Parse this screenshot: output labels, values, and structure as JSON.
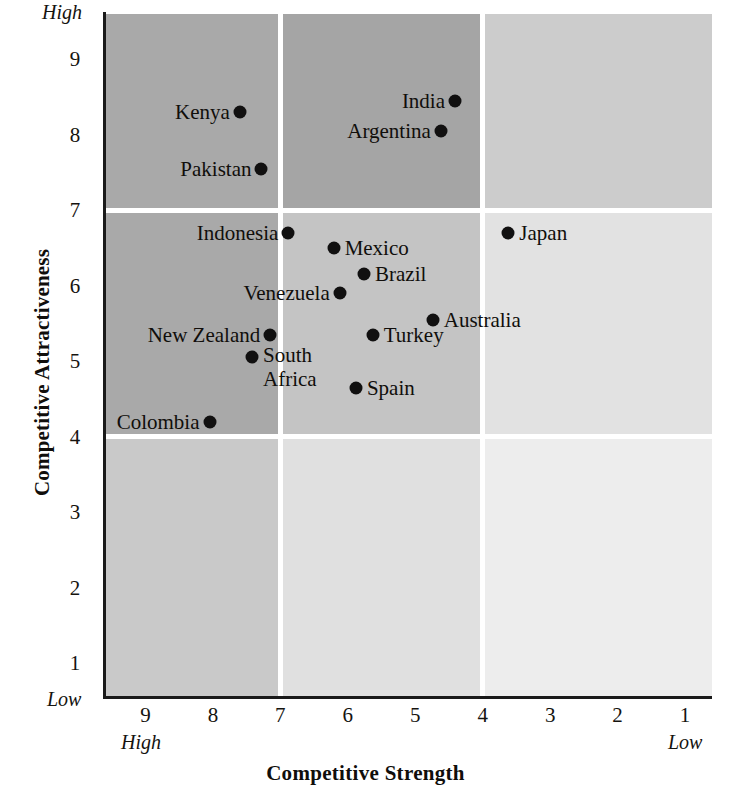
{
  "chart_data": {
    "type": "scatter",
    "title": "",
    "xlabel": "Competitive Strength",
    "ylabel": "Competitive Attractiveness",
    "xlim": [
      9.6,
      0.6
    ],
    "ylim": [
      0.55,
      9.6
    ],
    "x_reversed": true,
    "grid": true,
    "legend": "none",
    "x_ticks": [
      9,
      8,
      7,
      6,
      5,
      4,
      3,
      2,
      1
    ],
    "y_ticks": [
      9,
      8,
      7,
      6,
      5,
      4,
      3,
      2,
      1
    ],
    "x_axis_end_labels": {
      "left": "High",
      "right": "Low"
    },
    "y_axis_end_labels": {
      "top": "High",
      "bottom": "Low"
    },
    "quadrant_breaks": {
      "x": [
        7,
        4
      ],
      "y": [
        7,
        4
      ]
    },
    "quadrant_shades": [
      [
        "#a9a9a9",
        "#a5a5a5",
        "#cccccc"
      ],
      [
        "#a9a9a9",
        "#c4c4c4",
        "#e2e2e2"
      ],
      [
        "#c9c9c9",
        "#e0e0e0",
        "#ededed"
      ]
    ],
    "points": [
      {
        "name": "Kenya",
        "x": 7.6,
        "y": 8.3,
        "label_side": "left"
      },
      {
        "name": "Pakistan",
        "x": 7.28,
        "y": 7.55,
        "label_side": "left"
      },
      {
        "name": "India",
        "x": 4.41,
        "y": 8.45,
        "label_side": "left"
      },
      {
        "name": "Argentina",
        "x": 4.62,
        "y": 8.05,
        "label_side": "left"
      },
      {
        "name": "Indonesia",
        "x": 6.88,
        "y": 6.7,
        "label_side": "left"
      },
      {
        "name": "Japan",
        "x": 3.62,
        "y": 6.7,
        "label_side": "right"
      },
      {
        "name": "Mexico",
        "x": 6.21,
        "y": 6.5,
        "label_side": "right"
      },
      {
        "name": "Brazil",
        "x": 5.76,
        "y": 6.15,
        "label_side": "right"
      },
      {
        "name": "Venezuela",
        "x": 6.12,
        "y": 5.9,
        "label_side": "left"
      },
      {
        "name": "Australia",
        "x": 4.74,
        "y": 5.55,
        "label_side": "right"
      },
      {
        "name": "Turkey",
        "x": 5.63,
        "y": 5.35,
        "label_side": "right"
      },
      {
        "name": "New Zealand",
        "x": 7.15,
        "y": 5.35,
        "label_side": "left"
      },
      {
        "name": "South Africa",
        "x": 7.42,
        "y": 5.05,
        "label_side": "right"
      },
      {
        "name": "Spain",
        "x": 5.88,
        "y": 4.65,
        "label_side": "right"
      },
      {
        "name": "Colombia",
        "x": 8.05,
        "y": 4.2,
        "label_side": "left"
      }
    ]
  },
  "axes": {
    "y_title": "Competitive Attractiveness",
    "x_title": "Competitive Strength",
    "y_high": "High",
    "y_low": "Low",
    "x_high": "High",
    "x_low": "Low",
    "y_tick_labels": [
      "9",
      "8",
      "7",
      "6",
      "5",
      "4",
      "3",
      "2",
      "1"
    ],
    "x_tick_labels": [
      "9",
      "8",
      "7",
      "6",
      "5",
      "4",
      "3",
      "2",
      "1"
    ]
  },
  "colors": {
    "ink": "#100e0b",
    "axis": "#1a1a1a",
    "point": "#111010",
    "separator": "#ffffff"
  }
}
